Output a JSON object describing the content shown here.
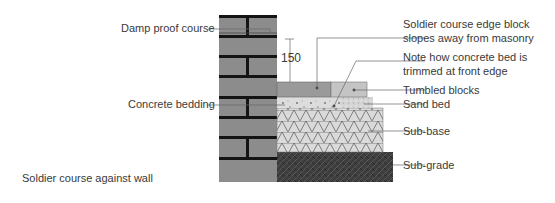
{
  "diagram": {
    "caption": "Soldier course against wall",
    "dimension": "150",
    "labels_left": {
      "damp_proof_course": "Damp proof course",
      "concrete_bedding": "Concrete bedding"
    },
    "labels_right": {
      "soldier_course": [
        "Soldier course edge block",
        "slopes away from masonry"
      ],
      "concrete_bed_note": [
        "Note how concrete bed is",
        "trimmed at front edge"
      ],
      "tumbled_blocks": "Tumbled blocks",
      "sand_bed": "Sand bed",
      "sub_base": "Sub-base",
      "sub_grade": "Sub-grade"
    },
    "colors": {
      "brick": "#8c8c8c",
      "mortar": "#141414",
      "soldier_block": "#9a9a9a",
      "tumbled_block": "#c4c4c4",
      "concrete_bed": "#dcdcdc",
      "sand_bed": "#d0d0d0",
      "sub_base": "#dadada",
      "sub_grade": "#3e3e3e",
      "leader": "#666666"
    }
  }
}
